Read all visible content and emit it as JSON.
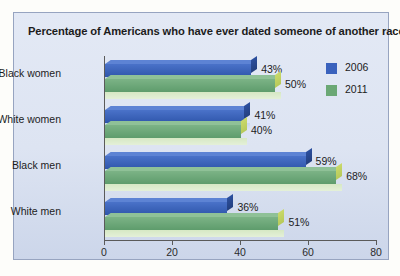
{
  "chart_data": {
    "type": "bar",
    "orientation": "horizontal",
    "title": "Percentage of Americans who have ever dated someone of another race",
    "xlabel": "",
    "ylabel": "",
    "xlim": [
      0,
      80
    ],
    "xticks": [
      0,
      20,
      40,
      60,
      80
    ],
    "grid": false,
    "legend_position": "right",
    "categories": [
      "Black women",
      "White women",
      "Black men",
      "White men"
    ],
    "series": [
      {
        "name": "2006",
        "color": "#3a62bd",
        "values": [
          43,
          41,
          59,
          36
        ],
        "labels": [
          "43%",
          "41%",
          "59%",
          "36%"
        ]
      },
      {
        "name": "2011",
        "color": "#6ba875",
        "values": [
          50,
          40,
          68,
          51
        ],
        "labels": [
          "50%",
          "40%",
          "68%",
          "51%"
        ]
      }
    ]
  },
  "legend": {
    "items": [
      {
        "label": "2006",
        "color": "#3a62bd"
      },
      {
        "label": "2011",
        "color": "#6ba875"
      }
    ]
  },
  "axis": {
    "tick_labels": [
      "0",
      "20",
      "40",
      "60",
      "80"
    ]
  }
}
